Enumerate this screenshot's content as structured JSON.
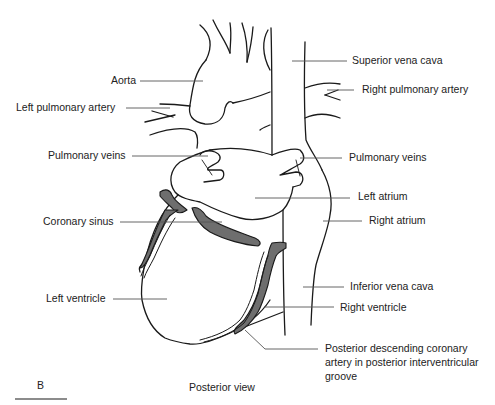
{
  "figure": {
    "panel_letter": "B",
    "caption": "Posterior view",
    "colors": {
      "outline": "#1a1a1a",
      "vessel_fill": "#6e6e6e",
      "leader_line": "#555555",
      "background": "#ffffff"
    }
  },
  "labels": {
    "left": [
      {
        "id": "aorta",
        "text": "Aorta"
      },
      {
        "id": "left-pulmonary-artery",
        "text": "Left pulmonary artery"
      },
      {
        "id": "pulmonary-veins-left",
        "text": "Pulmonary veins"
      },
      {
        "id": "coronary-sinus",
        "text": "Coronary sinus"
      },
      {
        "id": "left-ventricle",
        "text": "Left ventricle"
      }
    ],
    "right": [
      {
        "id": "superior-vena-cava",
        "text": "Superior vena cava"
      },
      {
        "id": "right-pulmonary-artery",
        "text": "Right pulmonary artery"
      },
      {
        "id": "pulmonary-veins-right",
        "text": "Pulmonary veins"
      },
      {
        "id": "left-atrium",
        "text": "Left atrium"
      },
      {
        "id": "right-atrium",
        "text": "Right atrium"
      },
      {
        "id": "inferior-vena-cava",
        "text": "Inferior vena cava"
      },
      {
        "id": "right-ventricle",
        "text": "Right ventricle"
      },
      {
        "id": "posterior-descending-coronary-artery",
        "text": "Posterior descending coronary artery in posterior interventricular groove"
      }
    ]
  }
}
